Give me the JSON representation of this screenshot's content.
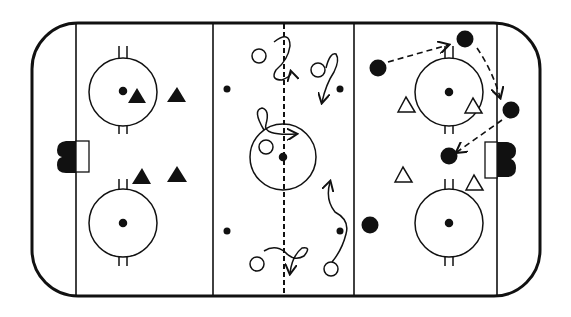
{
  "diagram": {
    "colors": {
      "ink": "#111111",
      "background": "#ffffff"
    },
    "rink": {
      "left": 32,
      "top": 23,
      "right": 540,
      "bottom": 296,
      "corner_radius": 46
    },
    "lines": {
      "goal_left_x": 76,
      "goal_right_x": 497,
      "blue_left_x": 213,
      "blue_right_x": 354,
      "center_x": 284,
      "center_style": "dashed"
    },
    "faceoff_circles": [
      {
        "id": "left-top",
        "cx": 123,
        "cy": 92,
        "r": 34
      },
      {
        "id": "left-bottom",
        "cx": 123,
        "cy": 223,
        "r": 34
      },
      {
        "id": "center",
        "cx": 283,
        "cy": 157,
        "r": 33
      },
      {
        "id": "right-top",
        "cx": 449,
        "cy": 92,
        "r": 34
      },
      {
        "id": "right-bottom",
        "cx": 449,
        "cy": 223,
        "r": 34
      }
    ],
    "neutral_dots": [
      {
        "cx": 227,
        "cy": 89
      },
      {
        "cx": 340,
        "cy": 89
      },
      {
        "cx": 227,
        "cy": 231
      },
      {
        "cx": 340,
        "cy": 231
      }
    ],
    "nets": [
      {
        "id": "left-net",
        "side": "left",
        "x": 76,
        "y": 141,
        "w": 12,
        "h": 32
      },
      {
        "id": "right-net",
        "side": "right",
        "x": 485,
        "y": 141,
        "w": 12,
        "h": 36
      }
    ],
    "players": {
      "filled_triangles": [
        {
          "x": 137,
          "y": 96
        },
        {
          "x": 177,
          "y": 96
        },
        {
          "x": 142,
          "y": 177
        },
        {
          "x": 177,
          "y": 175
        }
      ],
      "open_triangles": [
        {
          "x": 406,
          "y": 105
        },
        {
          "x": 473,
          "y": 105
        },
        {
          "x": 403,
          "y": 177
        },
        {
          "x": 474,
          "y": 183
        }
      ],
      "filled_circles": [
        {
          "x": 378,
          "y": 68
        },
        {
          "x": 465,
          "y": 39
        },
        {
          "x": 511,
          "y": 110
        },
        {
          "x": 449,
          "y": 156
        },
        {
          "x": 370,
          "y": 225
        }
      ],
      "open_circles": [
        {
          "x": 259,
          "y": 56
        },
        {
          "x": 318,
          "y": 70
        },
        {
          "x": 266,
          "y": 147
        },
        {
          "x": 257,
          "y": 264
        },
        {
          "x": 331,
          "y": 269
        }
      ]
    },
    "passes": [
      {
        "from": [
          388,
          62
        ],
        "to": [
          448,
          45
        ]
      },
      {
        "from": [
          477,
          48
        ],
        "to": [
          500,
          97
        ]
      },
      {
        "from": [
          502,
          120
        ],
        "to": [
          457,
          152
        ]
      }
    ]
  }
}
